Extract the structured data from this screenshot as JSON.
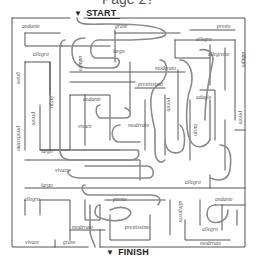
{
  "page": {
    "heading": "Page 2?"
  },
  "maze": {
    "start_label": "START",
    "finish_label": "FINISH",
    "start_icon": "triangle-down-icon",
    "finish_icon": "triangle-down-icon",
    "wall_color": "#444444",
    "path_color": "#8a8a8a",
    "labels": [
      {
        "id": "andante-1",
        "text": "andante",
        "x": 22,
        "y": 24,
        "vertical": false
      },
      {
        "id": "grave-1",
        "text": "grave",
        "x": 115,
        "y": 24,
        "vertical": false
      },
      {
        "id": "presto-1",
        "text": "presto",
        "x": 217,
        "y": 24,
        "vertical": false
      },
      {
        "id": "allegro-1",
        "text": "allegro",
        "x": 196,
        "y": 37,
        "vertical": false
      },
      {
        "id": "allegro-2",
        "text": "allegro",
        "x": 33,
        "y": 52,
        "vertical": false
      },
      {
        "id": "adagio-1",
        "text": "adagio",
        "x": 83,
        "y": 56,
        "vertical": true
      },
      {
        "id": "largo-1",
        "text": "largo",
        "x": 113,
        "y": 49,
        "vertical": false
      },
      {
        "id": "allegretto-1",
        "text": "allegretto",
        "x": 208,
        "y": 52,
        "vertical": false
      },
      {
        "id": "adagio-2",
        "text": "adagio",
        "x": 246,
        "y": 52,
        "vertical": true
      },
      {
        "id": "moderato-1",
        "text": "moderato",
        "x": 155,
        "y": 66,
        "vertical": false
      },
      {
        "id": "grave-2",
        "text": "grave",
        "x": 21,
        "y": 72,
        "vertical": true
      },
      {
        "id": "prestissimo-1",
        "text": "prestissimo",
        "x": 138,
        "y": 82,
        "vertical": false
      },
      {
        "id": "largo-2",
        "text": "largo",
        "x": 54,
        "y": 96,
        "vertical": true
      },
      {
        "id": "andante-2",
        "text": "andante",
        "x": 83,
        "y": 97,
        "vertical": false
      },
      {
        "id": "presto-2",
        "text": "presto",
        "x": 171,
        "y": 98,
        "vertical": true
      },
      {
        "id": "adagio-3",
        "text": "adagio",
        "x": 196,
        "y": 95,
        "vertical": false
      },
      {
        "id": "presto-3",
        "text": "presto",
        "x": 36,
        "y": 112,
        "vertical": true
      },
      {
        "id": "prestissimo-2",
        "text": "prestissimo",
        "x": 21,
        "y": 126,
        "vertical": true
      },
      {
        "id": "vivace-1",
        "text": "vivace",
        "x": 78,
        "y": 124,
        "vertical": false
      },
      {
        "id": "moderato-2",
        "text": "moderato",
        "x": 128,
        "y": 123,
        "vertical": false
      },
      {
        "id": "largo-3",
        "text": "largo",
        "x": 198,
        "y": 124,
        "vertical": true
      },
      {
        "id": "presto-4",
        "text": "presto",
        "x": 243,
        "y": 111,
        "vertical": true
      },
      {
        "id": "largo-4",
        "text": "largo",
        "x": 41,
        "y": 149,
        "vertical": false
      },
      {
        "id": "vivace-2",
        "text": "vivace",
        "x": 55,
        "y": 168,
        "vertical": false
      },
      {
        "id": "largo-5",
        "text": "largo",
        "x": 41,
        "y": 183,
        "vertical": false
      },
      {
        "id": "allegro-3",
        "text": "allegro",
        "x": 185,
        "y": 180,
        "vertical": false
      },
      {
        "id": "allegro-4",
        "text": "allegro",
        "x": 24,
        "y": 197,
        "vertical": false
      },
      {
        "id": "presto-5",
        "text": "presto",
        "x": 113,
        "y": 197,
        "vertical": false
      },
      {
        "id": "andante-3",
        "text": "andante",
        "x": 215,
        "y": 197,
        "vertical": false
      },
      {
        "id": "allegretto-2",
        "text": "allegretto",
        "x": 183,
        "y": 201,
        "vertical": true
      },
      {
        "id": "moderato-3",
        "text": "moderato",
        "x": 72,
        "y": 225,
        "vertical": false
      },
      {
        "id": "prestissimo-3",
        "text": "prestissimo",
        "x": 125,
        "y": 225,
        "vertical": false
      },
      {
        "id": "allegro-5",
        "text": "allegro",
        "x": 202,
        "y": 227,
        "vertical": false
      },
      {
        "id": "vivace-3",
        "text": "vivace",
        "x": 25,
        "y": 240,
        "vertical": false
      },
      {
        "id": "grave-3",
        "text": "grave",
        "x": 63,
        "y": 240,
        "vertical": false
      },
      {
        "id": "moderato-4",
        "text": "moderato",
        "x": 200,
        "y": 241,
        "vertical": false
      }
    ]
  }
}
